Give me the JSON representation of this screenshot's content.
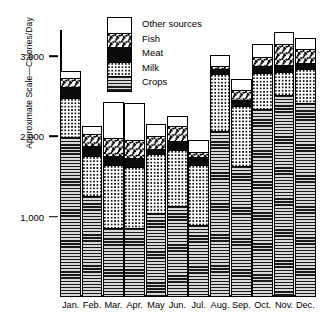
{
  "chart_data": {
    "type": "bar",
    "subtype": "stacked-bar",
    "title": "",
    "xlabel": "",
    "ylabel": "Approximate Scale—Calories/Day",
    "ylim": [
      0,
      3300
    ],
    "yticks": [
      1000,
      2000,
      3000
    ],
    "ytick_labels": [
      "1,000",
      "2,000",
      "3,000"
    ],
    "grid": false,
    "legend_position": "top-center",
    "categories": [
      "Jan.",
      "Feb.",
      "Mar.",
      "Apr.",
      "May",
      "Jun.",
      "Jul.",
      "Aug.",
      "Sep.",
      "Oct.",
      "Nov.",
      "Dec."
    ],
    "series": [
      {
        "name": "Crops",
        "pattern": "horizontal-lines",
        "values": [
          1980,
          1250,
          850,
          850,
          1030,
          1120,
          890,
          2060,
          1620,
          2330,
          2500,
          2400
        ]
      },
      {
        "name": "Milk",
        "pattern": "dots",
        "values": [
          490,
          490,
          780,
          760,
          740,
          700,
          740,
          700,
          740,
          450,
          290,
          430
        ]
      },
      {
        "name": "Meat",
        "pattern": "solid-black",
        "values": [
          135,
          125,
          110,
          110,
          60,
          110,
          100,
          70,
          80,
          85,
          85,
          75
        ]
      },
      {
        "name": "Fish",
        "pattern": "speckle",
        "values": [
          110,
          150,
          230,
          220,
          165,
          185,
          60,
          40,
          120,
          110,
          260,
          170
        ]
      },
      {
        "name": "Other sources",
        "pattern": "white",
        "values": [
          75,
          85,
          430,
          450,
          130,
          110,
          140,
          120,
          130,
          145,
          135,
          120
        ]
      }
    ],
    "totals": [
      2790,
      2100,
      2400,
      2390,
      2125,
      2225,
      1930,
      2990,
      2690,
      3120,
      3270,
      3195
    ]
  },
  "legend": {
    "items": [
      {
        "label": "Other sources",
        "pattern": "white"
      },
      {
        "label": "Fish",
        "pattern": "speckle"
      },
      {
        "label": "Meat",
        "pattern": "solid-black"
      },
      {
        "label": "Milk",
        "pattern": "dots"
      },
      {
        "label": "Crops",
        "pattern": "horizontal-lines"
      }
    ]
  },
  "colors": {
    "ink": "#000000",
    "paper": "#ffffff",
    "crops_gray": "#8d8d8d"
  }
}
